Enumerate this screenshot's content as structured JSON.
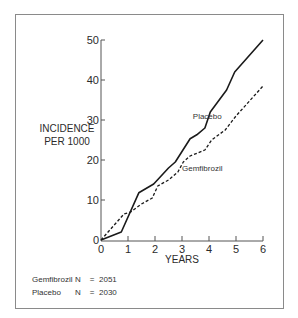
{
  "chart_data": {
    "type": "line",
    "title": "",
    "xlabel": "YEARS",
    "ylabel": "INCIDENCE PER 1000",
    "ylabel_lines": [
      "INCIDENCE",
      "PER 1000"
    ],
    "xlim": [
      0,
      6
    ],
    "ylim": [
      0,
      50
    ],
    "x_ticks": [
      0,
      1,
      2,
      3,
      4,
      5,
      6
    ],
    "y_ticks": [
      0,
      10,
      20,
      30,
      40,
      50
    ],
    "grid": false,
    "legend": "inline labels",
    "series": [
      {
        "name": "Placebo",
        "style": "solid",
        "color": "#1a1a1a",
        "x": [
          0,
          0.75,
          1.4,
          1.95,
          2.5,
          2.75,
          3.3,
          3.55,
          3.85,
          4.05,
          4.65,
          4.95,
          6
        ],
        "values": [
          0,
          2,
          11.8,
          14,
          18,
          19.5,
          25.3,
          26.3,
          28,
          32,
          37.5,
          42,
          50
        ]
      },
      {
        "name": "Gemfibrozil",
        "style": "dashed",
        "color": "#1a1a1a",
        "x": [
          0,
          0.85,
          1.1,
          1.5,
          1.9,
          2.1,
          2.5,
          2.85,
          3.05,
          3.3,
          3.85,
          4.1,
          4.6,
          5.0,
          6
        ],
        "values": [
          0,
          6.5,
          7,
          9,
          10.5,
          13.5,
          15,
          17,
          19.5,
          21,
          22.5,
          25,
          27.5,
          31,
          38.5
        ]
      }
    ],
    "annotations": [
      {
        "text": "Placebo",
        "x": 3.4,
        "y": 30.2
      },
      {
        "text": "Gemfibrozil",
        "x": 3.0,
        "y": 17.3
      }
    ]
  },
  "footnotes": [
    {
      "group": "Gemfibrozil",
      "n_label": "N",
      "eq": "=",
      "count": "2051"
    },
    {
      "group": "Placebo",
      "n_label": "N",
      "eq": "=",
      "count": "2030"
    }
  ],
  "layout": {
    "x0_px": 101,
    "px_per_year": 27,
    "y0_px": 240,
    "px_per_unit": 4
  }
}
